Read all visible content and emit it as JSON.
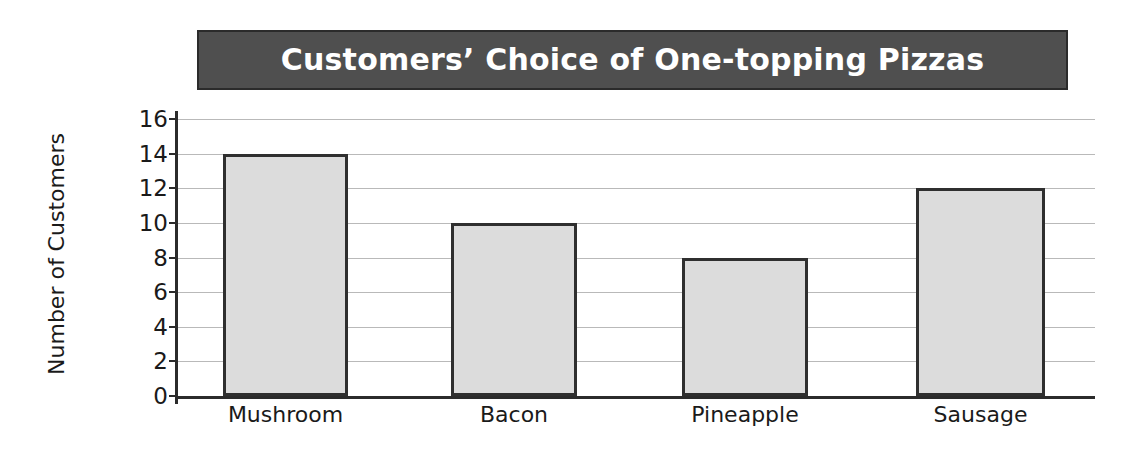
{
  "chart_data": {
    "type": "bar",
    "title": "Customers’ Choice of One-topping Pizzas",
    "xlabel": "",
    "ylabel": "Number of Customers",
    "categories": [
      "Mushroom",
      "Bacon",
      "Pineapple",
      "Sausage"
    ],
    "values": [
      14,
      10,
      8,
      12
    ],
    "ylim": [
      0,
      16
    ],
    "ytick_step": 2,
    "ytick_labels": [
      "0",
      "2",
      "4",
      "6",
      "8",
      "10",
      "12",
      "14",
      "16"
    ],
    "grid": true,
    "legend": false,
    "legend_position": "none",
    "colors": {
      "bar_fill": "#dcdcdc",
      "bar_border": "#2f2f2f",
      "title_banner_bg": "#4f4f4f",
      "title_text": "#ffffff",
      "axis": "#2b2b2b",
      "gridline": "#b9b9b9",
      "text": "#1a1a1a",
      "background": "#ffffff"
    }
  }
}
